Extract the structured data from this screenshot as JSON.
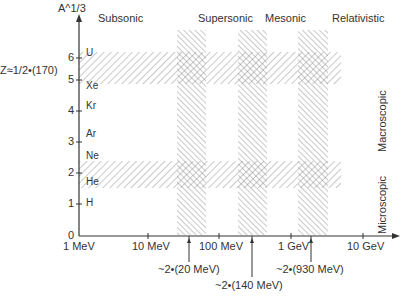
{
  "diagram": {
    "y_axis_label": "A^1/3",
    "y_ticks": [
      "0",
      "1",
      "2",
      "3",
      "4",
      "5",
      "6"
    ],
    "elements": [
      "H",
      "He",
      "Ne",
      "Ar",
      "Kr",
      "Xe",
      "U"
    ],
    "z_annotation": "Z≈1/2•(170)",
    "regimes": [
      "Subsonic",
      "Supersonic",
      "Mesonic",
      "Relativistic"
    ],
    "x_ticks": [
      "1 MeV",
      "10 MeV",
      "100 MeV",
      "1 GeV",
      "10 GeV"
    ],
    "thresholds": [
      "~2•(20 MeV)",
      "~2•(140 MeV)",
      "~2•(930 MeV)"
    ],
    "side_labels": [
      "Macroscopic",
      "Microscopic"
    ]
  }
}
